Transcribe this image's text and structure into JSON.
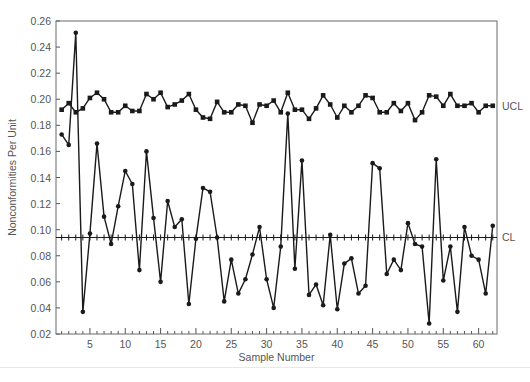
{
  "chart_data": {
    "type": "line",
    "title": "",
    "xlabel": "Sample Number",
    "ylabel": "Nonconformities Per Unit",
    "xlim": [
      0.2,
      62.6
    ],
    "ylim": [
      0.02,
      0.26
    ],
    "x_ticks": [
      5,
      10,
      15,
      20,
      25,
      30,
      35,
      40,
      45,
      50,
      55,
      60
    ],
    "y_ticks": [
      0.02,
      0.04,
      0.06,
      0.08,
      0.1,
      0.12,
      0.14,
      0.16,
      0.18,
      0.2,
      0.22,
      0.24,
      0.26
    ],
    "y_tick_labels": [
      "0.02",
      "0.04",
      "0.06",
      "0.08",
      "0.10",
      "0.12",
      "0.14",
      "0.16",
      "0.18",
      "0.20",
      "0.22",
      "0.24",
      "0.26"
    ],
    "grid": false,
    "x": [
      1,
      2,
      3,
      4,
      5,
      6,
      7,
      8,
      9,
      10,
      11,
      12,
      13,
      14,
      15,
      16,
      17,
      18,
      19,
      20,
      21,
      22,
      23,
      24,
      25,
      26,
      27,
      28,
      29,
      30,
      31,
      32,
      33,
      34,
      35,
      36,
      37,
      38,
      39,
      40,
      41,
      42,
      43,
      44,
      45,
      46,
      47,
      48,
      49,
      50,
      51,
      52,
      53,
      54,
      55,
      56,
      57,
      58,
      59,
      60,
      61,
      62
    ],
    "series": [
      {
        "name": "Nonconformities Per Unit",
        "marker": "circle",
        "values": [
          0.173,
          0.165,
          0.251,
          0.037,
          0.097,
          0.166,
          0.11,
          0.089,
          0.118,
          0.145,
          0.135,
          0.069,
          0.16,
          0.109,
          0.06,
          0.122,
          0.102,
          0.108,
          0.043,
          0.093,
          0.132,
          0.129,
          0.094,
          0.045,
          0.077,
          0.051,
          0.062,
          0.081,
          0.102,
          0.062,
          0.04,
          0.087,
          0.189,
          0.07,
          0.153,
          0.05,
          0.058,
          0.042,
          0.096,
          0.039,
          0.074,
          0.078,
          0.051,
          0.057,
          0.151,
          0.147,
          0.066,
          0.077,
          0.069,
          0.105,
          0.089,
          0.087,
          0.028,
          0.154,
          0.061,
          0.087,
          0.037,
          0.102,
          0.08,
          0.077,
          0.051,
          0.103
        ]
      },
      {
        "name": "UCL",
        "marker": "square",
        "values": [
          0.192,
          0.197,
          0.19,
          0.193,
          0.201,
          0.205,
          0.2,
          0.19,
          0.19,
          0.195,
          0.191,
          0.191,
          0.204,
          0.2,
          0.205,
          0.194,
          0.196,
          0.199,
          0.204,
          0.192,
          0.186,
          0.185,
          0.198,
          0.19,
          0.19,
          0.196,
          0.195,
          0.182,
          0.196,
          0.195,
          0.199,
          0.19,
          0.205,
          0.192,
          0.192,
          0.185,
          0.193,
          0.203,
          0.196,
          0.186,
          0.195,
          0.19,
          0.195,
          0.203,
          0.201,
          0.19,
          0.19,
          0.197,
          0.191,
          0.197,
          0.184,
          0.19,
          0.203,
          0.202,
          0.195,
          0.204,
          0.195,
          0.195,
          0.197,
          0.19,
          0.195,
          0.195
        ]
      }
    ],
    "center_line": {
      "name": "CL",
      "value": 0.094,
      "style": "solid with tick marks"
    },
    "annotations": [
      {
        "text": "UCL",
        "anchor": "right",
        "y": 0.195
      },
      {
        "text": "CL",
        "anchor": "right",
        "y": 0.094
      }
    ],
    "legend": null
  },
  "labels": {
    "xlabel": "Sample Number",
    "ylabel": "Nonconformities Per Unit",
    "ucl": "UCL",
    "cl": "CL"
  },
  "colors": {
    "line": "#1a1a1a",
    "axis": "#555555",
    "text": "#555555"
  }
}
